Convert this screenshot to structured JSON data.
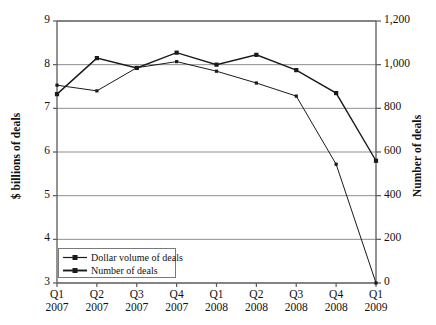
{
  "chart_data": {
    "type": "line",
    "title": "",
    "xlabel": "",
    "ylabel": "$ billions of deals",
    "y2label": "Number of deals",
    "grid": true,
    "legend_position": "bottom-left",
    "categories": [
      "Q1\n2007",
      "Q2\n2007",
      "Q3\n2007",
      "Q4\n2007",
      "Q1\n2008",
      "Q2\n2008",
      "Q3\n2008",
      "Q4\n2008",
      "Q1\n2009"
    ],
    "x_tick_quarters": [
      "Q1",
      "Q2",
      "Q3",
      "Q4",
      "Q1",
      "Q2",
      "Q3",
      "Q4",
      "Q1"
    ],
    "x_tick_years": [
      "2007",
      "2007",
      "2007",
      "2007",
      "2008",
      "2008",
      "2008",
      "2008",
      "2009"
    ],
    "ylim": [
      3,
      9
    ],
    "yticks": [
      3,
      4,
      5,
      6,
      7,
      8,
      9
    ],
    "ytick_labels": [
      "3",
      "4",
      "5",
      "6",
      "7",
      "8",
      "9"
    ],
    "y2lim": [
      0,
      1200
    ],
    "y2ticks": [
      0,
      200,
      400,
      600,
      800,
      1000,
      1200
    ],
    "y2tick_labels": [
      "0",
      "200",
      "400",
      "600",
      "800",
      "1,000",
      "1,200"
    ],
    "series": [
      {
        "name": "Dollar volume of deals",
        "axis": "left",
        "marker": "square",
        "color": "#1a1a1a",
        "values": [
          7.53,
          7.4,
          7.93,
          8.07,
          7.85,
          7.58,
          7.28,
          5.72,
          3.0
        ]
      },
      {
        "name": "Number of deals",
        "axis": "right",
        "marker": "square",
        "color": "#1a1a1a",
        "values": [
          865,
          1030,
          985,
          1055,
          1000,
          1045,
          975,
          870,
          560
        ]
      }
    ]
  },
  "legend": {
    "items": [
      {
        "label": "Dollar volume of deals"
      },
      {
        "label": "Number of deals"
      }
    ]
  },
  "colors": {
    "line": "#1a1a1a",
    "grid": "#8d8d8d",
    "axis": "#5a5a5a",
    "text": "#111111",
    "background": "#ffffff"
  }
}
